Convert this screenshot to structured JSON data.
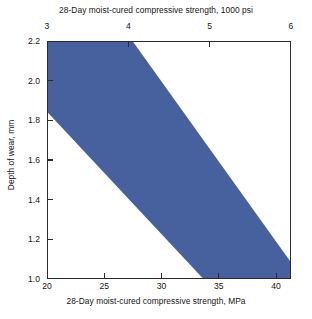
{
  "chart_data": {
    "type": "area",
    "title": "",
    "top_axis": {
      "label": "28-Day moist-cured compressive strength, 1000 psi",
      "ticks": [
        3,
        4,
        5,
        6
      ],
      "tick_labels": [
        "3",
        "4",
        "5",
        "6"
      ],
      "range": [
        3,
        6
      ]
    },
    "xlabel": "28-Day moist-cured compressive strength, MPa",
    "ylabel": "Depth of wear, mm",
    "xticks": [
      20,
      25,
      30,
      35,
      40
    ],
    "xtick_labels": [
      "20",
      "25",
      "30",
      "35",
      "40"
    ],
    "yticks": [
      1.0,
      1.2,
      1.4,
      1.6,
      1.8,
      2.0,
      2.2
    ],
    "ytick_labels": [
      "1.0",
      "1.2",
      "1.4",
      "1.6",
      "1.8",
      "2.0",
      "2.2"
    ],
    "xlim": [
      20,
      41.3
    ],
    "ylim": [
      1.0,
      2.2
    ],
    "grid": false,
    "legend": null,
    "band": {
      "name": "Range of depth of wear",
      "color": "#47619e",
      "description": "Shaded band showing depth of wear decreasing as 28-day compressive strength increases",
      "upper_bound": {
        "comment": "Upper (leftmost) boundary of the band",
        "points": [
          [
            20.0,
            2.2
          ],
          [
            27.5,
            1.0
          ]
        ]
      },
      "lower_bound": {
        "comment": "Lower (rightmost) boundary of the band",
        "points": [
          [
            20.0,
            1.84
          ],
          [
            41.3,
            1.0
          ]
        ]
      },
      "polygon_points": [
        [
          20.0,
          2.2
        ],
        [
          27.5,
          2.2
        ],
        [
          41.3,
          1.086
        ],
        [
          41.3,
          1.0
        ],
        [
          33.6,
          1.0
        ],
        [
          20.0,
          1.84
        ]
      ]
    },
    "colors": {
      "band": "#47619e",
      "axis": "#2b2b2b",
      "text": "#161616",
      "background": "#ffffff"
    }
  }
}
